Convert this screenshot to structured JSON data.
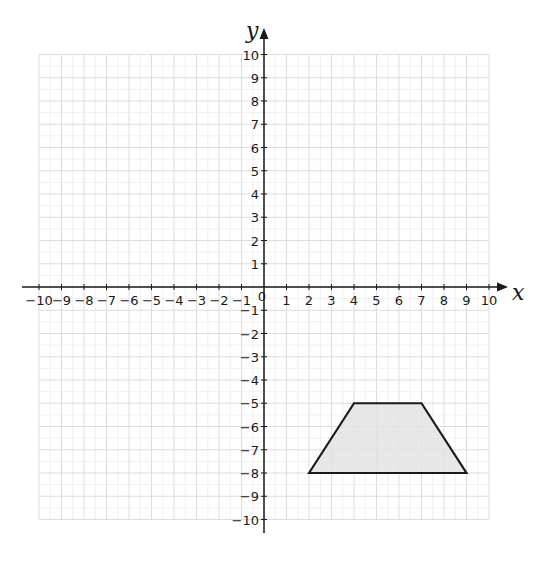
{
  "chart_data": {
    "type": "scatter",
    "title": "",
    "xlabel": "x",
    "ylabel": "y",
    "xlim": [
      -10,
      10
    ],
    "ylim": [
      -10,
      10
    ],
    "grid": true,
    "x_ticks": [
      -10,
      -9,
      -8,
      -7,
      -6,
      -5,
      -4,
      -3,
      -2,
      -1,
      1,
      2,
      3,
      4,
      5,
      6,
      7,
      8,
      9,
      10
    ],
    "y_ticks": [
      10,
      9,
      8,
      7,
      6,
      5,
      4,
      3,
      2,
      1,
      -1,
      -2,
      -3,
      -4,
      -5,
      -6,
      -7,
      -8,
      -9,
      -10
    ],
    "origin_label": "0",
    "shapes": [
      {
        "name": "trapezoid",
        "type": "polygon",
        "vertices": [
          [
            2,
            -8
          ],
          [
            4,
            -5
          ],
          [
            7,
            -5
          ],
          [
            9,
            -8
          ]
        ],
        "fill": "#e3e3e3",
        "stroke": "#1a1a1a"
      }
    ]
  },
  "colors": {
    "grid": "#d4d4d4",
    "axis": "#1a1a1a",
    "shape_fill": "#e3e3e3",
    "shape_stroke": "#1a1a1a"
  }
}
